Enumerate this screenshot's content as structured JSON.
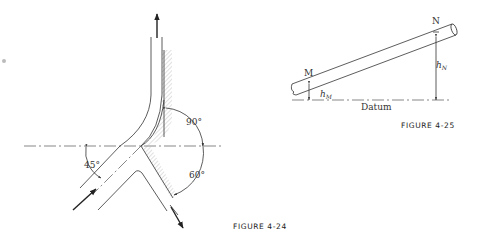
{
  "figure_4_24": {
    "caption": "FIGURE 4-24",
    "angles": {
      "inlet": "45°",
      "upper_outlet": "90°",
      "lower_outlet": "60°"
    },
    "arrows": [
      "inlet-arrow",
      "upper-outlet-arrow",
      "lower-outlet-arrow"
    ]
  },
  "figure_4_25": {
    "caption": "FIGURE 4-25",
    "point_m": "M",
    "point_n": "N",
    "height_m": "h",
    "height_m_sub": "M",
    "height_n": "h",
    "height_n_sub": "N",
    "datum_label": "Datum"
  }
}
